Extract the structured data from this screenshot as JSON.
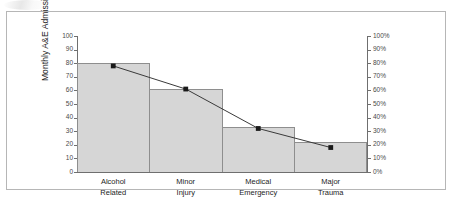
{
  "chart_data": {
    "type": "bar",
    "title": "",
    "subtitle": "",
    "xlabel": "",
    "ylabel": "Monthly A&E Admissions",
    "y2label": "",
    "categories": [
      "Alcohol Related",
      "Minor Injury",
      "Medical Emergency",
      "Major Trauma"
    ],
    "categories_wrapped": [
      [
        "Alcohol",
        "Related"
      ],
      [
        "Minor",
        "Injury"
      ],
      [
        "Medical",
        "Emergency"
      ],
      [
        "Major",
        "Trauma"
      ]
    ],
    "series": [
      {
        "name": "Monthly A&E Admissions",
        "type": "bar",
        "axis": "left",
        "values": [
          80,
          61,
          33,
          22
        ]
      },
      {
        "name": "Percentage",
        "type": "line",
        "axis": "right",
        "values": [
          78,
          61,
          32,
          18
        ]
      }
    ],
    "ylim": [
      0,
      100
    ],
    "y2lim": [
      0,
      100
    ],
    "yticks": [
      0,
      10,
      20,
      30,
      40,
      50,
      60,
      70,
      80,
      90,
      100
    ],
    "ytick_labels": [
      "0",
      "10",
      "20",
      "30",
      "40",
      "50",
      "60",
      "70",
      "80",
      "90",
      "100"
    ],
    "y2ticks": [
      0,
      10,
      20,
      30,
      40,
      50,
      60,
      70,
      80,
      90,
      100
    ],
    "y2tick_labels": [
      "0%",
      "10%",
      "20%",
      "30%",
      "40%",
      "50%",
      "60%",
      "70%",
      "80%",
      "90%",
      "100%"
    ],
    "grid": false,
    "legend": "none",
    "colors": {
      "bar_fill": "#d6d6d6",
      "bar_border": "#8e8e8e",
      "line": "#3a3a3a",
      "marker": "#1a1a1a",
      "axis": "#6f6f6f",
      "frame": "#b6b6b6",
      "text": "#1d1d1d",
      "tick_text": "#4a4a4a"
    }
  }
}
